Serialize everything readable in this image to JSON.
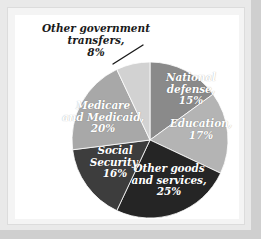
{
  "figure": {
    "background_color": "#ffffff",
    "frame_color": "#e9e9e9",
    "plate_color": "#ffffff"
  },
  "chart_data": {
    "type": "pie",
    "title": "",
    "subtitle": "",
    "xlabel": "",
    "ylabel": "",
    "legend_position": "none",
    "grid": false,
    "labels_inside": true,
    "start_angle_deg": 0,
    "direction": "clockwise",
    "categories": [
      "National defense",
      "Education",
      "Other goods and services",
      "Social Security",
      "Medicare and Medicaid",
      "Other government transfers"
    ],
    "values": [
      15,
      17,
      25,
      16,
      20,
      8
    ],
    "unit": "%",
    "total": 101,
    "slices": [
      {
        "name": "National defense",
        "value": 15,
        "percent_label": "15%",
        "label_text": "National\ndefense,\n15%",
        "color": "#8a8a8a",
        "text_color": "#ffffff",
        "label_placement": "inside",
        "start_deg": 0.0,
        "end_deg": 54.0
      },
      {
        "name": "Education",
        "value": 17,
        "percent_label": "17%",
        "label_text": "Education,\n17%",
        "color": "#b4b4b4",
        "text_color": "#ffffff",
        "label_placement": "inside",
        "start_deg": 54.0,
        "end_deg": 115.2
      },
      {
        "name": "Other goods and services",
        "value": 25,
        "percent_label": "25%",
        "label_text": "Other goods\nand services,\n25%",
        "color": "#252525",
        "text_color": "#ffffff",
        "label_placement": "inside",
        "start_deg": 115.2,
        "end_deg": 205.2
      },
      {
        "name": "Social Security",
        "value": 16,
        "percent_label": "16%",
        "label_text": "Social\nSecurity,\n16%",
        "color": "#3d3d3d",
        "text_color": "#ffffff",
        "label_placement": "inside",
        "start_deg": 205.2,
        "end_deg": 262.8
      },
      {
        "name": "Medicare and Medicaid",
        "value": 20,
        "percent_label": "20%",
        "label_text": "Medicare\nand Medicaid,\n20%",
        "color": "#a8a8a8",
        "text_color": "#ffffff",
        "label_placement": "inside",
        "start_deg": 262.8,
        "end_deg": 334.8
      },
      {
        "name": "Other government transfers",
        "value": 8,
        "percent_label": "8%",
        "label_text": "Other government transfers,\n8%",
        "color": "#d2d2d2",
        "text_color": "#1a1a1a",
        "label_placement": "outside-callout",
        "start_deg": 334.8,
        "end_deg": 360.0
      }
    ],
    "callout": {
      "label": "Other government transfers,\n8%",
      "leader_line": {
        "x1": 143,
        "y1": 45,
        "x2": 113,
        "y2": 64
      }
    },
    "geometry": {
      "cx": 150,
      "cy": 140,
      "r": 78
    }
  }
}
